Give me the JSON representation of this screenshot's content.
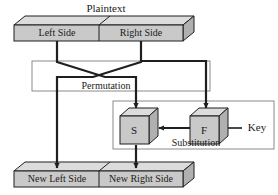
{
  "diagram": {
    "title": "Plaintext",
    "top_block": {
      "name": "plaintext-block",
      "left_label": "Left Side",
      "right_label": "Right Side"
    },
    "permutation": {
      "label": "Permutation"
    },
    "substitution": {
      "label": "Substitution",
      "s_box_label": "S",
      "f_box_label": "F",
      "key_label": "Key"
    },
    "bottom_block": {
      "name": "ciphertext-block",
      "left_label": "New Left Side",
      "right_label": "New Right Side"
    },
    "colors": {
      "front_face": "#c9c9c9",
      "top_face": "#dcdcdc",
      "side_face": "#b0b0b0",
      "outline": "#1f1f1f",
      "thin_outline": "#8a8a8a",
      "background": "#ffffff"
    }
  }
}
